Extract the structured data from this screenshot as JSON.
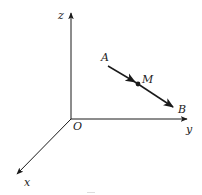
{
  "diagram": {
    "type": "3d-coordinate-system",
    "stroke_color": "#1a1a1a",
    "background": "#ffffff",
    "origin": {
      "label": "O",
      "x": 71,
      "y": 119
    },
    "axes": {
      "z": {
        "label": "z",
        "end": [
          71,
          12
        ]
      },
      "y": {
        "label": "y",
        "end": [
          188,
          119
        ]
      },
      "x": {
        "label": "x",
        "end": [
          16,
          175
        ]
      }
    },
    "points": {
      "A": {
        "label": "A",
        "x": 108,
        "y": 66
      },
      "M": {
        "label": "M",
        "x": 138,
        "y": 84
      },
      "B": {
        "label": "B",
        "x": 174,
        "y": 108
      }
    },
    "vector": {
      "from": "A",
      "to": "B",
      "midpoint": "M",
      "description": "Vector AB with midpoint M"
    }
  }
}
